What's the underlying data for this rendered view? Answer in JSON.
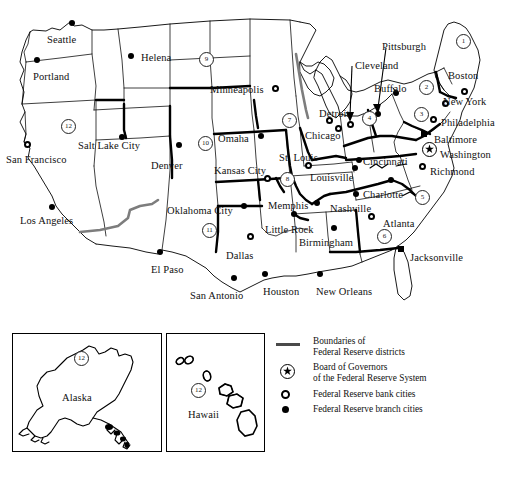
{
  "map": {
    "districts": [
      {
        "number": "1",
        "x": 462,
        "y": 40
      },
      {
        "number": "2",
        "x": 425,
        "y": 86
      },
      {
        "number": "3",
        "x": 420,
        "y": 113
      },
      {
        "number": "4",
        "x": 368,
        "y": 117
      },
      {
        "number": "5",
        "x": 421,
        "y": 196
      },
      {
        "number": "6",
        "x": 383,
        "y": 235
      },
      {
        "number": "7",
        "x": 288,
        "y": 119
      },
      {
        "number": "8",
        "x": 286,
        "y": 178
      },
      {
        "number": "9",
        "x": 205,
        "y": 58
      },
      {
        "number": "10",
        "x": 204,
        "y": 142
      },
      {
        "number": "11",
        "x": 208,
        "y": 229
      },
      {
        "number": "12",
        "x": 67,
        "y": 125
      }
    ],
    "cities": [
      {
        "name": "Seattle",
        "type": "branch",
        "mx": 72,
        "my": 23,
        "lx": 47,
        "ly": 35
      },
      {
        "name": "Portland",
        "type": "branch",
        "mx": 37,
        "my": 60,
        "lx": 33,
        "ly": 72
      },
      {
        "name": "Helena",
        "type": "branch",
        "mx": 131,
        "my": 56,
        "lx": 141,
        "ly": 53
      },
      {
        "name": "Minneapolis",
        "type": "bank",
        "mx": 275,
        "my": 88,
        "lx": 210,
        "ly": 85
      },
      {
        "name": "San Francisco",
        "type": "bank",
        "mx": 27,
        "my": 144,
        "lx": 6,
        "ly": 155
      },
      {
        "name": "Salt Lake City",
        "type": "branch",
        "mx": 122,
        "my": 137,
        "lx": 78,
        "ly": 141
      },
      {
        "name": "Los Angeles",
        "type": "branch",
        "mx": 52,
        "my": 207,
        "lx": 20,
        "ly": 216
      },
      {
        "name": "Denver",
        "type": "branch",
        "mx": 179,
        "my": 145,
        "lx": 151,
        "ly": 161
      },
      {
        "name": "Omaha",
        "type": "branch",
        "mx": 261,
        "my": 136,
        "lx": 218,
        "ly": 134
      },
      {
        "name": "Kansas City",
        "type": "bank",
        "mx": 267,
        "my": 178,
        "lx": 214,
        "ly": 166
      },
      {
        "name": "Oklahoma City",
        "type": "branch",
        "mx": 244,
        "my": 206,
        "lx": 167,
        "ly": 206
      },
      {
        "name": "El Paso",
        "type": "branch",
        "mx": 160,
        "my": 252,
        "lx": 151,
        "ly": 265
      },
      {
        "name": "Dallas",
        "type": "bank",
        "mx": 250,
        "my": 236,
        "lx": 226,
        "ly": 251
      },
      {
        "name": "San Antonio",
        "type": "branch",
        "mx": 234,
        "my": 278,
        "lx": 190,
        "ly": 291
      },
      {
        "name": "Houston",
        "type": "branch",
        "mx": 265,
        "my": 274,
        "lx": 263,
        "ly": 287
      },
      {
        "name": "Little Rock",
        "type": "branch",
        "mx": 294,
        "my": 214,
        "lx": 265,
        "ly": 225
      },
      {
        "name": "Memphis",
        "type": "branch",
        "mx": 317,
        "my": 203,
        "lx": 268,
        "ly": 201
      },
      {
        "name": "Birmingham",
        "type": "branch",
        "mx": 334,
        "my": 228,
        "lx": 299,
        "ly": 238
      },
      {
        "name": "New Orleans",
        "type": "branch",
        "mx": 320,
        "my": 274,
        "lx": 316,
        "ly": 287
      },
      {
        "name": "Nashville",
        "type": "branch",
        "mx": 356,
        "my": 194,
        "lx": 330,
        "ly": 204
      },
      {
        "name": "Atlanta",
        "type": "bank",
        "mx": 371,
        "my": 216,
        "lx": 383,
        "ly": 219
      },
      {
        "name": "Jacksonville",
        "type": "sq",
        "mx": 401,
        "my": 249,
        "lx": 410,
        "ly": 253
      },
      {
        "name": "Louisville",
        "type": "branch",
        "mx": 355,
        "my": 168,
        "lx": 310,
        "ly": 173
      },
      {
        "name": "St. Louis",
        "type": "bank",
        "mx": 308,
        "my": 165,
        "lx": 279,
        "ly": 153
      },
      {
        "name": "Chicago",
        "type": "bank",
        "mx": 338,
        "my": 128,
        "lx": 305,
        "ly": 131
      },
      {
        "name": "Detroit",
        "type": "bank",
        "mx": 329,
        "my": 120,
        "lx": 319,
        "ly": 109
      },
      {
        "name": "Cleveland",
        "type": "bank",
        "mx": 350,
        "my": 124,
        "lx": 355,
        "ly": 61
      },
      {
        "name": "Pittsburgh",
        "type": "branch",
        "mx": 378,
        "my": 114,
        "lx": 382,
        "ly": 42
      },
      {
        "name": "Buffalo",
        "type": "branch",
        "mx": 396,
        "my": 93,
        "lx": 374,
        "ly": 84
      },
      {
        "name": "Cincinnati",
        "type": "branch",
        "mx": 359,
        "my": 160,
        "lx": 363,
        "ly": 157
      },
      {
        "name": "Boston",
        "type": "bank",
        "mx": 464,
        "my": 91,
        "lx": 448,
        "ly": 71
      },
      {
        "name": "New York",
        "type": "bank",
        "mx": 445,
        "my": 103,
        "lx": 443,
        "ly": 97
      },
      {
        "name": "Philadelphia",
        "type": "bank",
        "mx": 433,
        "my": 119,
        "lx": 441,
        "ly": 118
      },
      {
        "name": "Baltimore",
        "type": "sq",
        "mx": 424,
        "my": 134,
        "lx": 434,
        "ly": 135
      },
      {
        "name": "Richmond",
        "type": "bank",
        "mx": 422,
        "my": 166,
        "lx": 430,
        "ly": 167
      },
      {
        "name": "Charlotte",
        "type": "branch",
        "mx": 391,
        "my": 180,
        "lx": 363,
        "ly": 190
      },
      {
        "name": "Washington",
        "type": "gov",
        "mx": 428,
        "my": 148,
        "lx": 440,
        "ly": 150
      }
    ]
  },
  "insets": [
    {
      "name": "Alaska",
      "label": "Alaska",
      "district": "12",
      "x": 12,
      "y": 333,
      "w": 148,
      "h": 117,
      "lx": 62,
      "ly": 393,
      "dx": 80,
      "dy": 357
    },
    {
      "name": "Hawaii",
      "label": "Hawaii",
      "district": "12",
      "x": 166,
      "y": 333,
      "w": 97,
      "h": 117,
      "lx": 188,
      "ly": 410,
      "dx": 197,
      "dy": 389
    }
  ],
  "legend": {
    "items": [
      {
        "symbol": "line",
        "line1": "Boundaries of",
        "line2": "Federal Reserve districts"
      },
      {
        "symbol": "star",
        "line1": "Board of Governors",
        "line2": "of the Federal Reserve System"
      },
      {
        "symbol": "open-dot",
        "line1": "Federal Reserve bank cities",
        "line2": ""
      },
      {
        "symbol": "filled-dot",
        "line1": "Federal Reserve branch cities",
        "line2": ""
      }
    ]
  },
  "colors": {
    "ink": "#000000",
    "boundary_gray": "#7d7d7d",
    "background": "#ffffff"
  }
}
